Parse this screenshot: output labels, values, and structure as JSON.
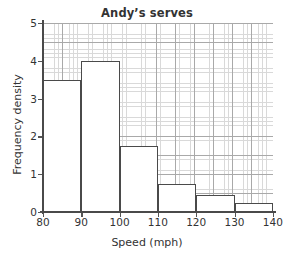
{
  "chart_data": {
    "type": "bar",
    "title": "Andy’s serves",
    "xlabel": "Speed (mph)",
    "ylabel": "Frequency density",
    "grid": true,
    "legend": "none",
    "xlim": [
      80,
      140
    ],
    "ylim": [
      0,
      5
    ],
    "x_ticks": [
      "80",
      "90",
      "100",
      "110",
      "120",
      "130",
      "140"
    ],
    "y_ticks": [
      "0",
      "1",
      "2",
      "3",
      "4",
      "5"
    ],
    "bin_edges": [
      80,
      90,
      100,
      110,
      120,
      130,
      140
    ],
    "categories": [
      "80-90",
      "90-100",
      "100-110",
      "110-120",
      "120-130",
      "130-140"
    ],
    "values": [
      3.5,
      4,
      1.75,
      0.75,
      0.45,
      0.25
    ],
    "bar_color": "#ffffff",
    "bar_edge_color": "#4a4a4a",
    "grid_color": "#d9d9d9",
    "grid_major_color": "#a9a9a9",
    "axis_color": "#4a4a4a"
  }
}
